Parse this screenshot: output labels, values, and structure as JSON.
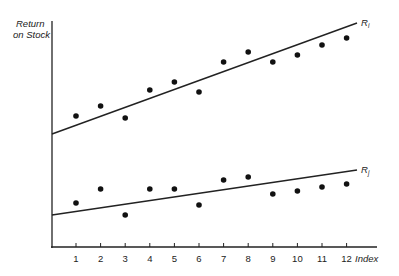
{
  "chart_data": {
    "type": "scatter",
    "title": "",
    "ylabel": "Return on Stock",
    "xlabel": "Index",
    "x": [
      1,
      2,
      3,
      4,
      5,
      6,
      7,
      8,
      9,
      10,
      11,
      12
    ],
    "grid": false,
    "series": [
      {
        "name": "Ri (upper)",
        "label": "R",
        "subscript": "i",
        "points_px_y": [
          116,
          106,
          118,
          90,
          82,
          92,
          62,
          52,
          62,
          55,
          45,
          38
        ],
        "values": [
          5.4,
          6.1,
          5.3,
          7.1,
          7.6,
          7.0,
          8.9,
          9.6,
          8.9,
          9.4,
          10.0,
          10.5
        ],
        "trend_line": {
          "start": [
            0,
            4.3
          ],
          "end": [
            12.4,
            11.4
          ]
        }
      },
      {
        "name": "Rj (lower)",
        "label": "R",
        "subscript": "j",
        "points_px_y": [
          203,
          189,
          215,
          189,
          189,
          205,
          180,
          177,
          194,
          191,
          187,
          184
        ],
        "values": [
          2.8,
          3.7,
          2.1,
          3.7,
          3.7,
          2.7,
          4.3,
          4.5,
          3.4,
          3.6,
          3.9,
          4.1
        ],
        "trend_line": {
          "start": [
            0,
            2.1
          ],
          "end": [
            12.4,
            4.9
          ]
        }
      }
    ],
    "axis": {
      "x_ticks": [
        "1",
        "2",
        "3",
        "4",
        "5",
        "6",
        "7",
        "8",
        "9",
        "10",
        "11",
        "12"
      ],
      "y_ticks": []
    }
  },
  "labels": {
    "y_axis_line1": "Return",
    "y_axis_line2": "on Stock",
    "x_axis": "Index",
    "upper_line": "R",
    "upper_sub": "i",
    "lower_line": "R",
    "lower_sub": "j"
  }
}
